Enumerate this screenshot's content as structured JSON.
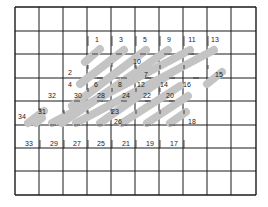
{
  "diagram": {
    "type": "stitch-chart",
    "grid": {
      "columns": 10,
      "rows": 8,
      "x_lines": [
        15,
        39,
        63,
        87,
        111,
        135,
        159,
        183,
        207,
        231,
        256
      ],
      "y_lines": [
        7,
        31,
        54,
        78,
        101,
        125,
        148,
        171,
        195
      ],
      "line_color": "#1a1a1a"
    },
    "stitch_color": "#c4c4c4",
    "stitches": [
      {
        "x1": 85,
        "y1": 62,
        "x2": 100,
        "y2": 49
      },
      {
        "x1": 80,
        "y1": 84,
        "x2": 124,
        "y2": 50
      },
      {
        "x1": 72,
        "y1": 106,
        "x2": 146,
        "y2": 50
      },
      {
        "x1": 62,
        "y1": 123,
        "x2": 168,
        "y2": 50
      },
      {
        "x1": 36,
        "y1": 123,
        "x2": 42,
        "y2": 118
      },
      {
        "x1": 52,
        "y1": 123,
        "x2": 190,
        "y2": 50
      },
      {
        "x1": 28,
        "y1": 123,
        "x2": 44,
        "y2": 111
      },
      {
        "x1": 76,
        "y1": 123,
        "x2": 214,
        "y2": 50
      },
      {
        "x1": 100,
        "y1": 123,
        "x2": 170,
        "y2": 74
      },
      {
        "x1": 122,
        "y1": 123,
        "x2": 180,
        "y2": 86
      },
      {
        "x1": 147,
        "y1": 123,
        "x2": 188,
        "y2": 96
      },
      {
        "x1": 170,
        "y1": 123,
        "x2": 186,
        "y2": 112
      },
      {
        "x1": 207,
        "y1": 84,
        "x2": 222,
        "y2": 72
      }
    ],
    "labels": [
      {
        "text": "1",
        "x": 97,
        "y": 42
      },
      {
        "text": "3",
        "x": 121,
        "y": 42
      },
      {
        "text": "5",
        "x": 145,
        "y": 42
      },
      {
        "text": "9",
        "x": 169,
        "y": 42
      },
      {
        "text": "11",
        "x": 192,
        "y": 42
      },
      {
        "text": "13",
        "x": 215,
        "y": 42
      },
      {
        "text": "10",
        "x": 137,
        "y": 64
      },
      {
        "text": "2",
        "x": 70,
        "y": 75
      },
      {
        "text": "7",
        "x": 146,
        "y": 77
      },
      {
        "text": "15",
        "x": 219,
        "y": 77
      },
      {
        "text": "4",
        "x": 70,
        "y": 87
      },
      {
        "text": "6",
        "x": 96,
        "y": 87
      },
      {
        "text": "8",
        "x": 120,
        "y": 87
      },
      {
        "text": "12",
        "x": 141,
        "y": 87
      },
      {
        "text": "14",
        "x": 164,
        "y": 87
      },
      {
        "text": "16",
        "x": 187,
        "y": 87
      },
      {
        "text": "32",
        "x": 52,
        "y": 98
      },
      {
        "text": "30",
        "x": 78,
        "y": 98
      },
      {
        "text": "28",
        "x": 101,
        "y": 98
      },
      {
        "text": "24",
        "x": 126,
        "y": 98
      },
      {
        "text": "22",
        "x": 147,
        "y": 98
      },
      {
        "text": "20",
        "x": 170,
        "y": 98
      },
      {
        "text": "31",
        "x": 42,
        "y": 114
      },
      {
        "text": "23",
        "x": 115,
        "y": 114
      },
      {
        "text": "34",
        "x": 22,
        "y": 119
      },
      {
        "text": "26",
        "x": 118,
        "y": 124
      },
      {
        "text": "18",
        "x": 192,
        "y": 124
      },
      {
        "text": "33",
        "x": 29,
        "y": 146
      },
      {
        "text": "29",
        "x": 54,
        "y": 146
      },
      {
        "text": "27",
        "x": 77,
        "y": 146
      },
      {
        "text": "25",
        "x": 101,
        "y": 146
      },
      {
        "text": "21",
        "x": 126,
        "y": 146
      },
      {
        "text": "19",
        "x": 150,
        "y": 146
      },
      {
        "text": "17",
        "x": 174,
        "y": 146
      }
    ],
    "ticks": [
      {
        "x1": 88,
        "y1": 36,
        "x2": 88,
        "y2": 46
      },
      {
        "x1": 112,
        "y1": 36,
        "x2": 112,
        "y2": 46
      },
      {
        "x1": 136,
        "y1": 36,
        "x2": 136,
        "y2": 46
      },
      {
        "x1": 160,
        "y1": 36,
        "x2": 160,
        "y2": 46
      },
      {
        "x1": 184,
        "y1": 36,
        "x2": 184,
        "y2": 46
      },
      {
        "x1": 208,
        "y1": 36,
        "x2": 208,
        "y2": 46
      },
      {
        "x1": 92,
        "y1": 54,
        "x2": 98,
        "y2": 54
      },
      {
        "x1": 116,
        "y1": 54,
        "x2": 122,
        "y2": 54
      },
      {
        "x1": 140,
        "y1": 54,
        "x2": 146,
        "y2": 54
      },
      {
        "x1": 164,
        "y1": 54,
        "x2": 170,
        "y2": 54
      },
      {
        "x1": 188,
        "y1": 54,
        "x2": 194,
        "y2": 54
      },
      {
        "x1": 88,
        "y1": 65,
        "x2": 88,
        "y2": 69
      },
      {
        "x1": 112,
        "y1": 63,
        "x2": 112,
        "y2": 67
      },
      {
        "x1": 136,
        "y1": 65,
        "x2": 136,
        "y2": 69
      },
      {
        "x1": 160,
        "y1": 65,
        "x2": 160,
        "y2": 69
      },
      {
        "x1": 184,
        "y1": 65,
        "x2": 184,
        "y2": 69
      },
      {
        "x1": 208,
        "y1": 65,
        "x2": 208,
        "y2": 69
      },
      {
        "x1": 97,
        "y1": 78,
        "x2": 103,
        "y2": 78
      },
      {
        "x1": 121,
        "y1": 78,
        "x2": 127,
        "y2": 78
      },
      {
        "x1": 145,
        "y1": 78,
        "x2": 151,
        "y2": 78
      },
      {
        "x1": 169,
        "y1": 78,
        "x2": 175,
        "y2": 78
      },
      {
        "x1": 193,
        "y1": 78,
        "x2": 199,
        "y2": 78
      },
      {
        "x1": 88,
        "y1": 88,
        "x2": 88,
        "y2": 92
      },
      {
        "x1": 112,
        "y1": 88,
        "x2": 112,
        "y2": 92
      },
      {
        "x1": 136,
        "y1": 88,
        "x2": 136,
        "y2": 92
      },
      {
        "x1": 160,
        "y1": 88,
        "x2": 160,
        "y2": 92
      },
      {
        "x1": 74,
        "y1": 101,
        "x2": 80,
        "y2": 101
      },
      {
        "x1": 97,
        "y1": 101,
        "x2": 103,
        "y2": 101
      },
      {
        "x1": 121,
        "y1": 101,
        "x2": 127,
        "y2": 101
      },
      {
        "x1": 145,
        "y1": 101,
        "x2": 151,
        "y2": 101
      },
      {
        "x1": 169,
        "y1": 101,
        "x2": 175,
        "y2": 101
      },
      {
        "x1": 40,
        "y1": 108,
        "x2": 40,
        "y2": 112
      },
      {
        "x1": 64,
        "y1": 110,
        "x2": 64,
        "y2": 114
      },
      {
        "x1": 88,
        "y1": 110,
        "x2": 88,
        "y2": 114
      },
      {
        "x1": 112,
        "y1": 110,
        "x2": 112,
        "y2": 114
      },
      {
        "x1": 136,
        "y1": 110,
        "x2": 136,
        "y2": 114
      },
      {
        "x1": 160,
        "y1": 110,
        "x2": 160,
        "y2": 114
      },
      {
        "x1": 184,
        "y1": 110,
        "x2": 184,
        "y2": 114
      },
      {
        "x1": 50,
        "y1": 125,
        "x2": 56,
        "y2": 125
      },
      {
        "x1": 74,
        "y1": 125,
        "x2": 80,
        "y2": 125
      },
      {
        "x1": 97,
        "y1": 125,
        "x2": 103,
        "y2": 125
      },
      {
        "x1": 121,
        "y1": 125,
        "x2": 127,
        "y2": 125
      },
      {
        "x1": 145,
        "y1": 125,
        "x2": 151,
        "y2": 125
      },
      {
        "x1": 169,
        "y1": 125,
        "x2": 175,
        "y2": 125
      },
      {
        "x1": 40,
        "y1": 140,
        "x2": 40,
        "y2": 148
      },
      {
        "x1": 64,
        "y1": 140,
        "x2": 64,
        "y2": 148
      },
      {
        "x1": 88,
        "y1": 140,
        "x2": 88,
        "y2": 148
      },
      {
        "x1": 112,
        "y1": 140,
        "x2": 112,
        "y2": 148
      },
      {
        "x1": 136,
        "y1": 140,
        "x2": 136,
        "y2": 148
      },
      {
        "x1": 160,
        "y1": 140,
        "x2": 160,
        "y2": 148
      },
      {
        "x1": 184,
        "y1": 140,
        "x2": 184,
        "y2": 148
      }
    ]
  }
}
